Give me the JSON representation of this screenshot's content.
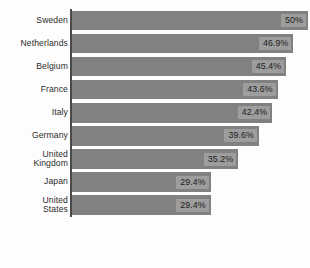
{
  "chart_data": {
    "type": "bar",
    "orientation": "horizontal",
    "title": "",
    "subtitle": "",
    "xlabel": "",
    "ylabel": "",
    "grid": false,
    "legend": false,
    "legend_position": "none",
    "axis_visible": "y-axis-only",
    "xlim": [
      0,
      50
    ],
    "value_suffix": "%",
    "bar_color": "#818181",
    "value_label_bg": "#9d9d9d",
    "axis_color": "#4a4a4a",
    "background_color": "#fdfdfd",
    "text_color": "#2b2b2b",
    "categories": [
      "Sweden",
      "Netherlands",
      "Belgium",
      "France",
      "Italy",
      "Germany",
      "United\nKingdom",
      "Japan",
      "United\nStates"
    ],
    "values": [
      50,
      46.9,
      45.4,
      43.6,
      42.4,
      39.6,
      35.2,
      29.4,
      29.4
    ],
    "value_labels": [
      "50%",
      "46.9%",
      "45.4%",
      "43.6%",
      "42.4%",
      "39.6%",
      "35.2%",
      "29.4%",
      "29.4%"
    ]
  }
}
